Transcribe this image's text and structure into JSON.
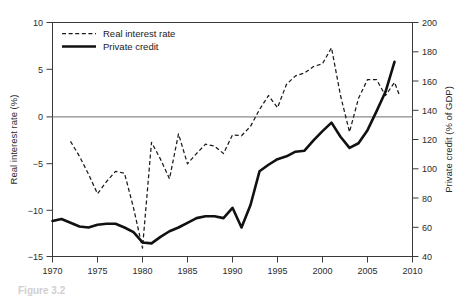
{
  "figure": {
    "caption": "Figure 3.2"
  },
  "chart_data": {
    "type": "line",
    "title": "",
    "xlabel": "",
    "ylabel": "Real interest rate (%)",
    "y2label": "Private credit (% of GDP)",
    "xlim": [
      1970,
      2010
    ],
    "ylim": [
      -15,
      10
    ],
    "y2lim": [
      40,
      200
    ],
    "grid": false,
    "legend_position": "top-left",
    "xticks": [
      1970,
      1975,
      1980,
      1985,
      1990,
      1995,
      2000,
      2005,
      2010
    ],
    "xticklabels": [
      "1970",
      "1975",
      "1980",
      "1985",
      "1990",
      "1995",
      "2000",
      "2005",
      "2010"
    ],
    "yticks": [
      -15,
      -10,
      -5,
      0,
      5,
      10
    ],
    "yticklabels": [
      "−15",
      "−10",
      "−5",
      "0",
      "5",
      "10"
    ],
    "y2ticks": [
      40,
      60,
      80,
      100,
      120,
      140,
      160,
      180,
      200
    ],
    "y2ticklabels": [
      "40",
      "60",
      "80",
      "100",
      "120",
      "140",
      "160",
      "180",
      "200"
    ],
    "zero_reference_line": 0,
    "series": [
      {
        "name": "Real interest rate",
        "style": "dashed",
        "axis": "left",
        "units": "%",
        "x": [
          1972,
          1973,
          1974,
          1975,
          1976,
          1977,
          1978,
          1979,
          1980,
          1981,
          1982,
          1983,
          1984,
          1985,
          1986,
          1987,
          1988,
          1989,
          1990,
          1991,
          1992,
          1993,
          1994,
          1995,
          1996,
          1997,
          1998,
          1999,
          2000,
          2001,
          2002,
          2003,
          2004,
          2005,
          2006,
          2007,
          2008
        ],
        "values": [
          -2.7,
          -4.3,
          -6.2,
          -8.3,
          -7.0,
          -5.9,
          -6.1,
          -9.8,
          -14.1,
          -2.8,
          -4.6,
          -6.7,
          -1.9,
          -5.1,
          -4.0,
          -3.0,
          -3.2,
          -4.0,
          -2.0,
          -2.1,
          -1.1,
          0.7,
          2.2,
          0.9,
          3.4,
          4.3,
          4.6,
          5.3,
          5.6,
          7.3,
          2.2,
          -1.7,
          1.9,
          3.9,
          3.9,
          2.2,
          3.6
        ],
        "end_value": 2.1
      },
      {
        "name": "Private credit",
        "style": "solid",
        "axis": "right",
        "units": "% of GDP",
        "x": [
          1970,
          1971,
          1972,
          1973,
          1974,
          1975,
          1976,
          1977,
          1978,
          1979,
          1980,
          1981,
          1982,
          1983,
          1984,
          1985,
          1986,
          1987,
          1988,
          1989,
          1990,
          1991,
          1992,
          1993,
          1994,
          1995,
          1996,
          1997,
          1998,
          1999,
          2000,
          2001,
          2002,
          2003,
          2004,
          2005,
          2006,
          2007,
          2008
        ],
        "values_left_axis": [
          -11.2,
          -11.0,
          -11.4,
          -11.8,
          -11.9,
          -11.6,
          -11.5,
          -11.5,
          -11.9,
          -12.4,
          -13.5,
          -13.6,
          -12.9,
          -12.3,
          -11.9,
          -11.4,
          -10.9,
          -10.7,
          -10.7,
          -10.9,
          -9.8,
          -11.9,
          -9.5,
          -5.9,
          -5.2,
          -4.6,
          -4.3,
          -3.8,
          -3.7,
          -2.6,
          -1.6,
          -0.7,
          -2.2,
          -3.4,
          -2.9,
          -1.5,
          0.5,
          2.6,
          5.8
        ],
        "values": [
          62,
          63,
          61,
          59,
          58,
          60,
          61,
          61,
          58,
          55,
          49,
          48,
          53,
          59,
          61,
          64,
          67,
          68,
          68,
          67,
          74,
          60,
          76,
          99,
          106,
          110,
          112,
          116,
          117,
          127,
          134,
          140,
          131,
          116,
          122,
          138,
          150,
          163,
          173
        ]
      }
    ],
    "legend": [
      {
        "label": "Real interest rate",
        "style": "dashed"
      },
      {
        "label": "Private credit",
        "style": "solid"
      }
    ]
  }
}
